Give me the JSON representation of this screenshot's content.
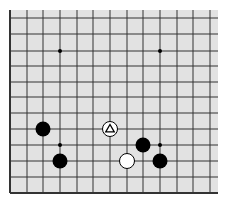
{
  "board": {
    "description": "Partial Go board (lower-left region shown)",
    "colors": {
      "background": "#e2e2e2",
      "line": "#333333",
      "black_stone": "#000000",
      "white_stone": "#ffffff",
      "star_point": "#000000"
    },
    "columns_x": [
      10,
      27,
      43,
      60,
      77,
      93,
      110,
      127,
      143,
      160,
      177,
      193,
      210
    ],
    "rows_y": [
      18,
      34,
      51,
      66,
      82,
      97,
      113,
      129,
      145,
      161,
      177,
      193
    ],
    "left_edge": true,
    "bottom_edge": true,
    "star_points": [
      {
        "col": 3,
        "row": 2
      },
      {
        "col": 9,
        "row": 2
      },
      {
        "col": 3,
        "row": 8
      },
      {
        "col": 9,
        "row": 8
      }
    ],
    "stones": [
      {
        "color": "black",
        "col": 2,
        "row": 7,
        "marker": null
      },
      {
        "color": "black",
        "col": 3,
        "row": 9,
        "marker": null
      },
      {
        "color": "white",
        "col": 6,
        "row": 7,
        "marker": "triangle"
      },
      {
        "color": "black",
        "col": 8,
        "row": 8,
        "marker": null
      },
      {
        "color": "white",
        "col": 7,
        "row": 9,
        "marker": null
      },
      {
        "color": "black",
        "col": 9,
        "row": 9,
        "marker": null
      }
    ]
  }
}
